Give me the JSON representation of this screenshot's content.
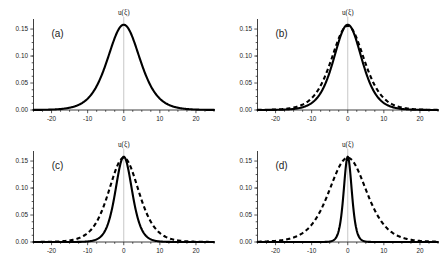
{
  "figure": {
    "axis_label": "u(ξ)",
    "panels": [
      {
        "letter": "(a)"
      },
      {
        "letter": "(b)"
      },
      {
        "letter": "(c)"
      },
      {
        "letter": "(d)"
      }
    ]
  },
  "chart_data": [
    {
      "type": "line",
      "title": "(a)",
      "xlabel": "",
      "ylabel": "u(ξ)",
      "xlim": [
        -25,
        25
      ],
      "ylim": [
        0,
        0.175
      ],
      "xticks": [
        -20,
        -10,
        0,
        10,
        20
      ],
      "yticks": [
        0.0,
        0.05,
        0.1,
        0.15
      ],
      "xticklabels": [
        "-20",
        "-10",
        "0",
        "10",
        "20"
      ],
      "yticklabels": [
        "0.00",
        "0.05",
        "0.10",
        "0.15"
      ],
      "grid": false,
      "legend": "none",
      "series": [
        {
          "name": "solid",
          "style": "solid",
          "peak": 0.158,
          "center": 0,
          "halfwidth": 6.0,
          "profile": "sech2"
        }
      ]
    },
    {
      "type": "line",
      "title": "(b)",
      "xlabel": "",
      "ylabel": "u(ξ)",
      "xlim": [
        -25,
        25
      ],
      "ylim": [
        0,
        0.175
      ],
      "xticks": [
        -20,
        -10,
        0,
        10,
        20
      ],
      "yticks": [
        0.0,
        0.05,
        0.1,
        0.15
      ],
      "xticklabels": [
        "-20",
        "-10",
        "0",
        "10",
        "20"
      ],
      "yticklabels": [
        "0.00",
        "0.05",
        "0.10",
        "0.15"
      ],
      "grid": false,
      "legend": "none",
      "series": [
        {
          "name": "solid",
          "style": "solid",
          "peak": 0.158,
          "center": 0,
          "halfwidth": 5.2,
          "profile": "sech2"
        },
        {
          "name": "dashed",
          "style": "dashed",
          "peak": 0.156,
          "center": 0,
          "halfwidth": 6.1,
          "profile": "sech2"
        }
      ]
    },
    {
      "type": "line",
      "title": "(c)",
      "xlabel": "",
      "ylabel": "u(ξ)",
      "xlim": [
        -25,
        25
      ],
      "ylim": [
        0,
        0.175
      ],
      "xticks": [
        -20,
        -10,
        0,
        10,
        20
      ],
      "yticks": [
        0.0,
        0.05,
        0.1,
        0.15
      ],
      "xticklabels": [
        "-20",
        "-10",
        "0",
        "10",
        "20"
      ],
      "yticklabels": [
        "0.00",
        "0.05",
        "0.10",
        "0.15"
      ],
      "grid": false,
      "legend": "none",
      "series": [
        {
          "name": "solid",
          "style": "solid",
          "peak": 0.158,
          "center": 0,
          "halfwidth": 3.1,
          "profile": "sech2"
        },
        {
          "name": "dashed",
          "style": "dashed",
          "peak": 0.156,
          "center": 0,
          "halfwidth": 5.6,
          "profile": "sech2"
        }
      ]
    },
    {
      "type": "line",
      "title": "(d)",
      "xlabel": "",
      "ylabel": "u(ξ)",
      "xlim": [
        -25,
        25
      ],
      "ylim": [
        0,
        0.175
      ],
      "xticks": [
        -20,
        -10,
        0,
        10,
        20
      ],
      "yticks": [
        0.0,
        0.05,
        0.1,
        0.15
      ],
      "xticklabels": [
        "-20",
        "-10",
        "0",
        "10",
        "20"
      ],
      "yticklabels": [
        "0.00",
        "0.05",
        "0.10",
        "0.15"
      ],
      "grid": false,
      "legend": "none",
      "series": [
        {
          "name": "solid",
          "style": "solid",
          "peak": 0.158,
          "center": 0,
          "halfwidth": 1.5,
          "profile": "sech2"
        },
        {
          "name": "dashed",
          "style": "dashed",
          "peak": 0.156,
          "center": 0,
          "halfwidth": 7.0,
          "profile": "sech2"
        }
      ]
    }
  ]
}
